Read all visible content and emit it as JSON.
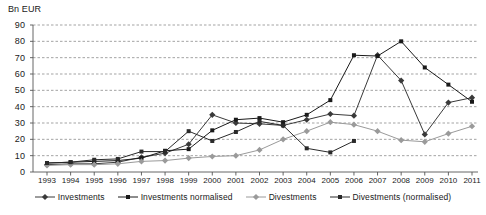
{
  "chart_data": {
    "type": "line",
    "title": "",
    "xlabel": "",
    "ylabel": "Bn EUR",
    "ylim": [
      0,
      90
    ],
    "ytick_step": 10,
    "grid": true,
    "legend_position": "bottom",
    "yticks": [
      0,
      10,
      20,
      30,
      40,
      50,
      60,
      70,
      80,
      90
    ],
    "categories": [
      "1993",
      "1994",
      "1995",
      "1996",
      "1997",
      "1998",
      "1999",
      "2000",
      "2001",
      "2002",
      "2003",
      "2004",
      "2005",
      "2006",
      "2007",
      "2008",
      "2009",
      "2010",
      "2011"
    ],
    "series": [
      {
        "name": "Investments",
        "marker": "diamond",
        "color": "#3a3a3a",
        "values": [
          4.5,
          5.0,
          5.0,
          6.0,
          9.0,
          11.5,
          17.0,
          35.0,
          30.0,
          29.5,
          28.5,
          32.0,
          35.5,
          34.5,
          71.5,
          56.0,
          23.0,
          42.5,
          45.5
        ]
      },
      {
        "name": "Investments normalised",
        "marker": "square",
        "color": "#1a1a1a",
        "values": [
          5.5,
          6.0,
          6.5,
          7.0,
          8.5,
          13.0,
          14.0,
          25.5,
          32.0,
          33.0,
          30.5,
          35.0,
          44.0,
          71.5,
          71.0,
          80.0,
          64.0,
          53.5,
          43.0
        ]
      },
      {
        "name": "Divestments",
        "marker": "diamond",
        "color": "#9a9a9a",
        "values": [
          4.0,
          4.5,
          4.5,
          5.0,
          6.5,
          7.0,
          8.5,
          9.5,
          10.0,
          13.5,
          20.0,
          25.0,
          30.5,
          29.0,
          25.0,
          19.5,
          18.5,
          23.5,
          28.0
        ]
      },
      {
        "name": "Divestments (normalised)",
        "marker": "square",
        "color": "#2a2a2a",
        "values": [
          5.5,
          6.0,
          7.5,
          8.0,
          12.5,
          12.5,
          25.0,
          19.0,
          24.5,
          31.0,
          28.5,
          14.5,
          12.0,
          19.0,
          null,
          null,
          null,
          null,
          null
        ]
      }
    ]
  },
  "legend": {
    "items": [
      {
        "label": "Investments"
      },
      {
        "label": "Investments normalised"
      },
      {
        "label": "Divestments"
      },
      {
        "label": "Divestments (normalised)"
      }
    ]
  }
}
